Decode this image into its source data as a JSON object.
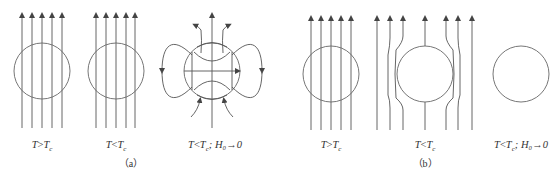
{
  "figure": {
    "panel_a": {
      "caption": "（a）",
      "subfigures": [
        {
          "label_T": "T",
          "label_rel": ">",
          "label_Tc": "T",
          "label_c": "c",
          "label_extra": ""
        },
        {
          "label_T": "T",
          "label_rel": "<",
          "label_Tc": "T",
          "label_c": "c",
          "label_extra": ""
        },
        {
          "label_T": "T",
          "label_rel": "<",
          "label_Tc": "T",
          "label_c": "c",
          "label_extra": "; H₀→0"
        }
      ]
    },
    "panel_b": {
      "caption": "（b）",
      "subfigures": [
        {
          "label_T": "T",
          "label_rel": ">",
          "label_Tc": "T",
          "label_c": "c",
          "label_extra": ""
        },
        {
          "label_T": "T",
          "label_rel": "<",
          "label_Tc": "T",
          "label_c": "c",
          "label_extra": ""
        },
        {
          "label_T": "T",
          "label_rel": "<",
          "label_Tc": "T",
          "label_c": "c",
          "label_extra": "; H₀→0"
        }
      ]
    }
  }
}
